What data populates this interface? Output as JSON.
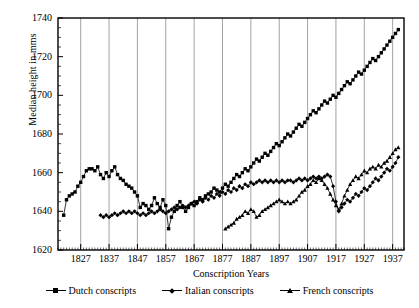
{
  "chart_data": {
    "type": "line",
    "title": "",
    "xlabel": "Conscription Years",
    "ylabel": "Median height in mms",
    "xlim": [
      1819,
      1941
    ],
    "ylim": [
      1620,
      1740
    ],
    "xticks": [
      1827,
      1837,
      1847,
      1857,
      1867,
      1877,
      1887,
      1897,
      1907,
      1917,
      1927,
      1937
    ],
    "yticks": [
      1620,
      1640,
      1660,
      1680,
      1700,
      1720,
      1740
    ],
    "grid": "vertical-only",
    "legend_position": "below-axes",
    "marker_color": "#000000",
    "line_color": "#000000",
    "series": [
      {
        "name": "Dutch conscripts",
        "marker": "square",
        "x": [
          1821,
          1822,
          1823,
          1824,
          1825,
          1826,
          1827,
          1828,
          1829,
          1830,
          1831,
          1832,
          1833,
          1834,
          1835,
          1836,
          1837,
          1838,
          1839,
          1840,
          1841,
          1842,
          1843,
          1844,
          1845,
          1846,
          1847,
          1848,
          1849,
          1850,
          1851,
          1852,
          1853,
          1854,
          1855,
          1856,
          1857,
          1858,
          1859,
          1860,
          1861,
          1862,
          1863,
          1864,
          1865,
          1866,
          1867,
          1868,
          1869,
          1870,
          1871,
          1872,
          1873,
          1874,
          1875,
          1876,
          1877,
          1878,
          1879,
          1880,
          1881,
          1882,
          1883,
          1884,
          1885,
          1886,
          1887,
          1888,
          1889,
          1890,
          1891,
          1892,
          1893,
          1894,
          1895,
          1896,
          1897,
          1898,
          1899,
          1900,
          1901,
          1902,
          1903,
          1904,
          1905,
          1906,
          1907,
          1908,
          1909,
          1910,
          1911,
          1912,
          1913,
          1914,
          1915,
          1916,
          1917,
          1918,
          1919,
          1920,
          1921,
          1922,
          1923,
          1924,
          1925,
          1926,
          1927,
          1928,
          1929,
          1930,
          1931,
          1932,
          1933,
          1934,
          1935,
          1936,
          1937,
          1938,
          1939
        ],
        "y": [
          1638,
          1646,
          1648,
          1649,
          1650,
          1653,
          1655,
          1658,
          1661,
          1662,
          1662,
          1661,
          1663,
          1659,
          1657,
          1660,
          1658,
          1661,
          1663,
          1659,
          1657,
          1656,
          1654,
          1653,
          1652,
          1650,
          1648,
          1642,
          1644,
          1643,
          1641,
          1643,
          1647,
          1644,
          1642,
          1646,
          1643,
          1631,
          1637,
          1640,
          1643,
          1645,
          1642,
          1640,
          1642,
          1644,
          1643,
          1645,
          1647,
          1646,
          1648,
          1649,
          1650,
          1652,
          1651,
          1650,
          1652,
          1654,
          1653,
          1655,
          1657,
          1659,
          1658,
          1660,
          1662,
          1661,
          1663,
          1665,
          1667,
          1666,
          1668,
          1670,
          1669,
          1671,
          1673,
          1675,
          1674,
          1676,
          1678,
          1680,
          1679,
          1681,
          1683,
          1685,
          1684,
          1686,
          1688,
          1690,
          1692,
          1691,
          1693,
          1695,
          1697,
          1696,
          1698,
          1700,
          1699,
          1701,
          1703,
          1705,
          1707,
          1706,
          1708,
          1710,
          1712,
          1711,
          1713,
          1715,
          1717,
          1719,
          1718,
          1720,
          1722,
          1724,
          1726,
          1728,
          1730,
          1732,
          1734
        ]
      },
      {
        "name": "Italian conscripts",
        "marker": "diamond",
        "x": [
          1834,
          1835,
          1836,
          1837,
          1838,
          1839,
          1840,
          1841,
          1842,
          1843,
          1844,
          1845,
          1846,
          1847,
          1848,
          1849,
          1850,
          1851,
          1852,
          1853,
          1854,
          1855,
          1856,
          1857,
          1858,
          1859,
          1860,
          1861,
          1862,
          1863,
          1864,
          1865,
          1866,
          1867,
          1868,
          1869,
          1870,
          1871,
          1872,
          1873,
          1874,
          1875,
          1876,
          1877,
          1878,
          1879,
          1880,
          1881,
          1882,
          1883,
          1884,
          1885,
          1886,
          1887,
          1888,
          1889,
          1890,
          1891,
          1892,
          1893,
          1894,
          1895,
          1896,
          1897,
          1898,
          1899,
          1900,
          1901,
          1902,
          1903,
          1904,
          1905,
          1906,
          1907,
          1908,
          1909,
          1910,
          1911,
          1912,
          1913,
          1914,
          1915,
          1916,
          1917,
          1918,
          1919,
          1920,
          1921,
          1922,
          1923,
          1924,
          1925,
          1926,
          1927,
          1928,
          1929,
          1930,
          1931,
          1932,
          1933,
          1934,
          1935,
          1936,
          1937,
          1938,
          1939
        ],
        "y": [
          1638,
          1637,
          1638,
          1637,
          1638,
          1639,
          1638,
          1639,
          1640,
          1639,
          1640,
          1639,
          1640,
          1639,
          1638,
          1639,
          1638,
          1639,
          1640,
          1639,
          1640,
          1641,
          1640,
          1639,
          1640,
          1641,
          1642,
          1641,
          1642,
          1643,
          1642,
          1643,
          1644,
          1645,
          1644,
          1646,
          1645,
          1647,
          1646,
          1648,
          1647,
          1649,
          1648,
          1650,
          1649,
          1651,
          1650,
          1652,
          1651,
          1653,
          1652,
          1654,
          1653,
          1655,
          1654,
          1655,
          1656,
          1655,
          1656,
          1655,
          1656,
          1655,
          1656,
          1655,
          1656,
          1655,
          1656,
          1656,
          1655,
          1656,
          1657,
          1656,
          1657,
          1656,
          1657,
          1658,
          1657,
          1658,
          1657,
          1658,
          1659,
          1658,
          1653,
          1645,
          1640,
          1642,
          1644,
          1646,
          1645,
          1647,
          1649,
          1648,
          1650,
          1652,
          1651,
          1653,
          1655,
          1657,
          1656,
          1658,
          1660,
          1662,
          1661,
          1663,
          1665,
          1668
        ]
      },
      {
        "name": "French conscripts",
        "marker": "triangle",
        "x": [
          1878,
          1879,
          1880,
          1881,
          1882,
          1883,
          1884,
          1885,
          1886,
          1887,
          1888,
          1889,
          1890,
          1891,
          1892,
          1893,
          1894,
          1895,
          1896,
          1897,
          1898,
          1899,
          1900,
          1901,
          1902,
          1903,
          1904,
          1905,
          1906,
          1907,
          1908,
          1909,
          1910,
          1911,
          1912,
          1913,
          1914,
          1915,
          1916,
          1917,
          1918,
          1919,
          1920,
          1921,
          1922,
          1923,
          1924,
          1925,
          1926,
          1927,
          1928,
          1929,
          1930,
          1931,
          1932,
          1933,
          1934,
          1935,
          1936,
          1937,
          1938,
          1939
        ],
        "y": [
          1631,
          1632,
          1633,
          1634,
          1636,
          1637,
          1638,
          1640,
          1639,
          1641,
          1640,
          1637,
          1638,
          1640,
          1641,
          1642,
          1643,
          1644,
          1645,
          1646,
          1645,
          1644,
          1645,
          1644,
          1645,
          1646,
          1648,
          1650,
          1651,
          1653,
          1654,
          1656,
          1655,
          1657,
          1656,
          1654,
          1652,
          1649,
          1646,
          1643,
          1641,
          1644,
          1648,
          1651,
          1654,
          1656,
          1658,
          1657,
          1659,
          1661,
          1660,
          1662,
          1663,
          1662,
          1664,
          1663,
          1665,
          1666,
          1668,
          1670,
          1672,
          1673
        ]
      }
    ]
  },
  "legend": {
    "items": [
      {
        "label": "Dutch conscripts",
        "marker": "square"
      },
      {
        "label": "Italian conscripts",
        "marker": "diamond"
      },
      {
        "label": "French conscripts",
        "marker": "triangle"
      }
    ]
  }
}
